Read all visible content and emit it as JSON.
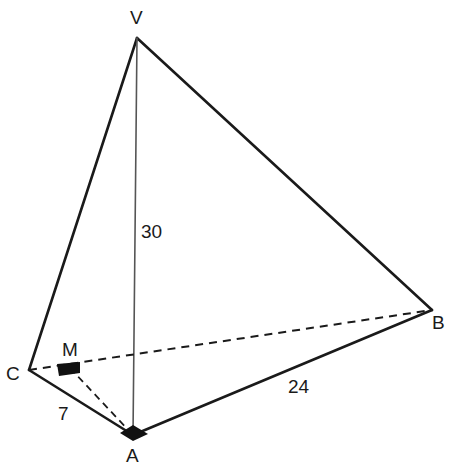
{
  "figure": {
    "kind": "geometry-diagram",
    "background_color": "#ffffff",
    "stroke_color": "#1a1a1a",
    "altitude_stroke_color": "#555555",
    "canvas": {
      "width": 450,
      "height": 472
    }
  },
  "vertices": [
    {
      "id": "V",
      "label": "V",
      "x": 137,
      "y": 38,
      "role": "apex"
    },
    {
      "id": "B",
      "label": "B",
      "x": 432,
      "y": 310,
      "role": "base-corner"
    },
    {
      "id": "C",
      "label": "C",
      "x": 29,
      "y": 370,
      "role": "base-corner"
    },
    {
      "id": "A",
      "label": "A",
      "x": 133,
      "y": 435,
      "role": "base-corner"
    },
    {
      "id": "M",
      "label": "M",
      "x": 70,
      "y": 368,
      "role": "perpendicular-foot"
    }
  ],
  "edges": [
    {
      "id": "VC",
      "from": "V",
      "to": "C",
      "style": "solid",
      "weight": "thick"
    },
    {
      "id": "VB",
      "from": "V",
      "to": "B",
      "style": "solid",
      "weight": "thick"
    },
    {
      "id": "CA",
      "from": "C",
      "to": "A",
      "style": "solid",
      "weight": "thick"
    },
    {
      "id": "AB",
      "from": "A",
      "to": "B",
      "style": "solid",
      "weight": "thick"
    },
    {
      "id": "VA",
      "from": "V",
      "to": "A",
      "style": "solid",
      "weight": "thin"
    },
    {
      "id": "CB",
      "from": "C",
      "to": "B",
      "style": "dashed",
      "weight": "thin"
    },
    {
      "id": "MA",
      "from": "M",
      "to": "A",
      "style": "dashed",
      "weight": "thin"
    }
  ],
  "measurements": [
    {
      "id": "VA",
      "label": "30",
      "on_edge": "VA",
      "x": 141,
      "y": 222
    },
    {
      "id": "AB",
      "label": "24",
      "on_edge": "AB",
      "x": 288,
      "y": 377
    },
    {
      "id": "CA",
      "label": "7",
      "on_edge": "CA",
      "x": 58,
      "y": 404
    }
  ],
  "right_angle_markers": [
    {
      "id": "at-M",
      "at_vertex": "M",
      "fill": "#111111",
      "points": "57,364 80,362 80,373 59,376"
    },
    {
      "id": "at-A",
      "at_vertex": "A",
      "fill": "#111111",
      "points": "133,425 148,434 133,441 120,433"
    }
  ],
  "geometry_values": {
    "altitude_VA": "30",
    "side_AB": "24",
    "side_CA": "7"
  }
}
